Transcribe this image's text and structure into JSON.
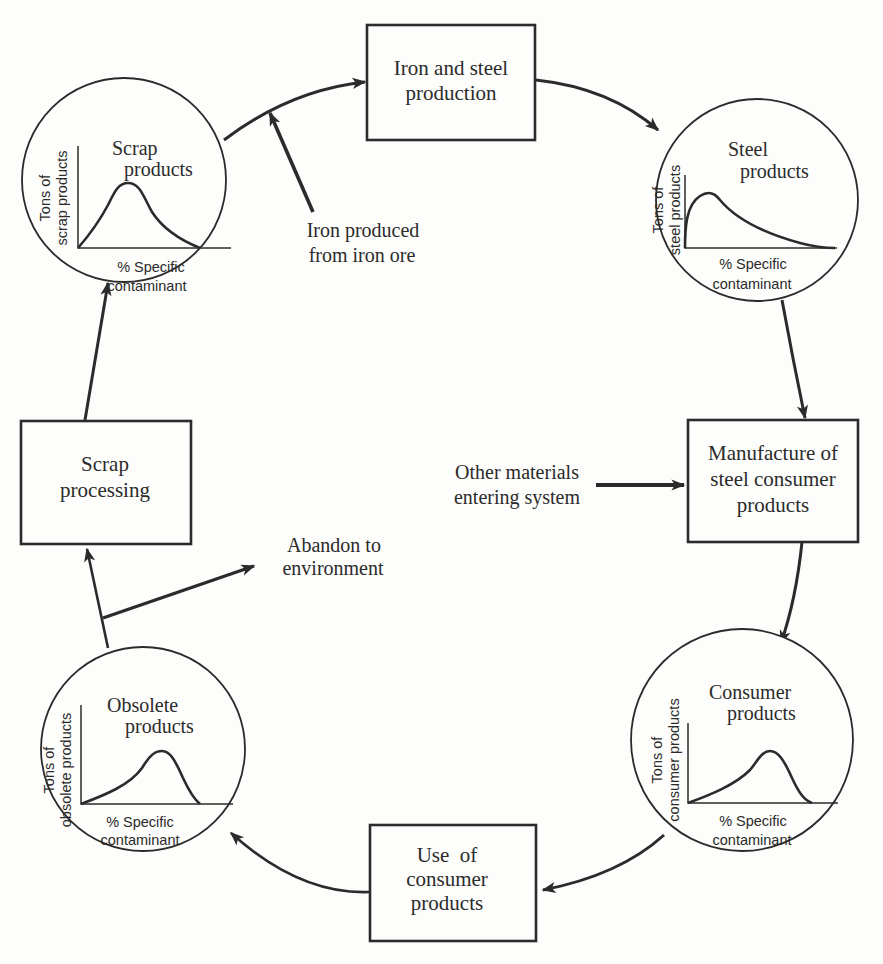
{
  "diagram": {
    "type": "cycle-flow",
    "boxes": {
      "iron_steel": {
        "line1": "Iron and steel",
        "line2": "production"
      },
      "manufacture": {
        "line1": "Manufacture of",
        "line2": "steel consumer",
        "line3": "products"
      },
      "use": {
        "line1": "Use  of",
        "line2": "consumer",
        "line3": "products"
      },
      "scrap_processing": {
        "line1": "Scrap",
        "line2": "processing"
      }
    },
    "circles": {
      "steel": {
        "title1": "Steel",
        "title2": "products",
        "ylabel1": "Tons of",
        "ylabel2": "steel products",
        "xlabel1": "% Specific",
        "xlabel2": "contaminant"
      },
      "consumer": {
        "title1": "Consumer",
        "title2": "products",
        "ylabel1": "Tons of",
        "ylabel2": "consumer products",
        "xlabel1": "% Specific",
        "xlabel2": "contaminant"
      },
      "obsolete": {
        "title1": "Obsolete",
        "title2": "products",
        "ylabel1": "Tons of",
        "ylabel2": "obsolete products",
        "xlabel1": "% Specific",
        "xlabel2": "contaminant"
      },
      "scrap": {
        "title1": "Scrap",
        "title2": "products",
        "ylabel1": "Tons of",
        "ylabel2": "scrap products",
        "xlabel1": "% Specific",
        "xlabel2": "contaminant"
      }
    },
    "external_inputs": {
      "iron_ore": {
        "line1": "Iron produced",
        "line2": "from iron ore"
      },
      "other_materials": {
        "line1": "Other materials",
        "line2": "entering system"
      }
    },
    "external_outputs": {
      "abandon": {
        "line1": "Abandon to",
        "line2": "environment"
      }
    },
    "flow_order": [
      "Iron and steel production",
      "Steel products",
      "Manufacture of steel consumer products",
      "Consumer products",
      "Use of consumer products",
      "Obsolete products",
      "Scrap processing",
      "Scrap products"
    ],
    "colors": {
      "ink": "#2b2b2b",
      "paper": "#fdfdfb"
    }
  }
}
